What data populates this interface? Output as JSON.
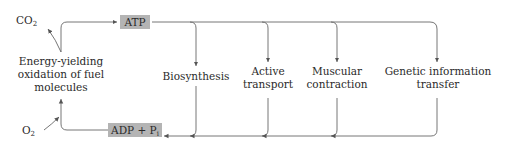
{
  "diagram": {
    "inputs": {
      "co2": {
        "base": "CO",
        "sub": "2"
      },
      "o2": {
        "base": "O",
        "sub": "2"
      }
    },
    "source_process": {
      "lines": [
        "Energy-yielding",
        "oxidation of fuel",
        "molecules"
      ]
    },
    "atp_box": {
      "label": "ATP",
      "fill": "#b4b4b4"
    },
    "adp_box": {
      "base": "ADP + P",
      "sub": "i",
      "fill": "#b4b4b4"
    },
    "consumers": [
      {
        "lines": [
          "Biosynthesis"
        ]
      },
      {
        "lines": [
          "Active",
          "transport"
        ]
      },
      {
        "lines": [
          "Muscular",
          "contraction"
        ]
      },
      {
        "lines": [
          "Genetic information",
          "transfer"
        ]
      }
    ],
    "line_color": "#555555"
  }
}
